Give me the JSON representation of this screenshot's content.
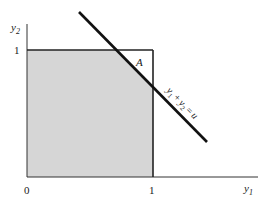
{
  "figure": {
    "axes": {
      "x_label": "y",
      "x_label_sub": "1",
      "y_label": "y",
      "y_label_sub": "2",
      "origin_label": "0",
      "x_tick_label": "1",
      "y_tick_label": "1"
    },
    "region_label": "A",
    "line_label": {
      "a": "y",
      "a_sub": "1",
      "plus": "+",
      "b": "y",
      "b_sub": "2",
      "eq": "=",
      "rhs": "u"
    },
    "colors": {
      "shade": "#d6d6d6",
      "ink": "#1a1a1a"
    }
  }
}
